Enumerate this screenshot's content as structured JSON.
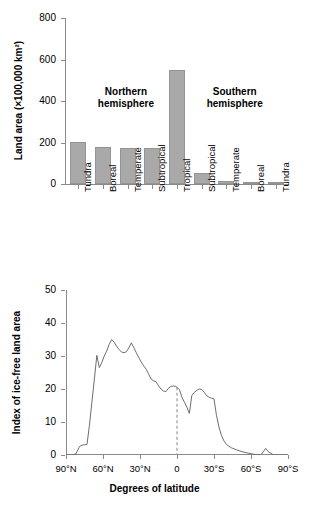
{
  "chart_data": [
    {
      "type": "bar",
      "panel": "top",
      "title": "",
      "xlabel": "",
      "ylabel": "Land area (×100,000 km²)",
      "ylim": [
        0,
        800
      ],
      "yticks": [
        0,
        200,
        400,
        600,
        800
      ],
      "ytick_labels": [
        "0",
        "200",
        "400",
        "600",
        "800"
      ],
      "grid": false,
      "bar_color": "#a9a9a9",
      "bar_edge_color": "#949494",
      "categories": [
        "Tundra",
        "Boreal",
        "Temperate",
        "Subtropical",
        "Tropical",
        "Subtropical",
        "Temperate",
        "Boreal",
        "Tundra"
      ],
      "values": [
        203,
        180,
        172,
        175,
        550,
        52,
        15,
        5,
        5
      ],
      "annotations": [
        {
          "text_line1": "Northern",
          "text_line2": "hemisphere",
          "x_frac": 0.27,
          "y_value": 470
        },
        {
          "text_line1": "Southern",
          "text_line2": "hemisphere",
          "x_frac": 0.76,
          "y_value": 470
        }
      ]
    },
    {
      "type": "line",
      "panel": "bottom",
      "title": "",
      "xlabel": "Degrees of latitude",
      "ylabel": "Index of ice-free land area",
      "ylim": [
        0,
        50
      ],
      "yticks": [
        0,
        10,
        20,
        30,
        40,
        50
      ],
      "ytick_labels": [
        "0",
        "10",
        "20",
        "30",
        "40",
        "50"
      ],
      "xlim": [
        90,
        -90
      ],
      "xticks": [
        90,
        60,
        30,
        0,
        -30,
        -60,
        -90
      ],
      "xtick_labels": [
        "90°N",
        "60°N",
        "30°N",
        "0",
        "30°S",
        "60°S",
        "90°S"
      ],
      "grid": false,
      "line_color": "#6e6e6e",
      "reference_line": {
        "x": 0,
        "style": "dashed",
        "color": "#9a9a9a",
        "y_top": 20.5
      },
      "series": [
        {
          "name": "Index of ice-free land area",
          "x": [
            90,
            86,
            82,
            79,
            77,
            75,
            73,
            71,
            69,
            67,
            65,
            63,
            61,
            59,
            57,
            55,
            53,
            51,
            49,
            47,
            45,
            43,
            41,
            39,
            37,
            35,
            33,
            31,
            29,
            27,
            25,
            23,
            21,
            19,
            17,
            15,
            13,
            11,
            9,
            7,
            5,
            3,
            1,
            0,
            -2,
            -4,
            -6,
            -8,
            -10,
            -12,
            -14,
            -16,
            -18,
            -20,
            -22,
            -24,
            -26,
            -28,
            -30,
            -32,
            -34,
            -36,
            -38,
            -40,
            -44,
            -48,
            -52,
            -56,
            -60,
            -64,
            -68,
            -70,
            -72,
            -74,
            -78,
            -82,
            -90
          ],
          "y": [
            0,
            0,
            0.3,
            2.6,
            3.0,
            3.1,
            3.2,
            9.0,
            16.0,
            23.0,
            30.2,
            26.5,
            28.0,
            30.0,
            31.5,
            33.5,
            35.0,
            34.2,
            33.0,
            32.0,
            31.2,
            31.0,
            31.3,
            32.5,
            34.0,
            32.5,
            31.0,
            29.5,
            28.2,
            27.0,
            26.0,
            24.5,
            23.0,
            22.5,
            22.2,
            21.0,
            20.0,
            19.4,
            19.2,
            20.2,
            20.8,
            20.9,
            20.8,
            20.5,
            19.8,
            17.5,
            16.0,
            14.5,
            12.6,
            18.0,
            19.0,
            19.6,
            20.0,
            19.9,
            19.0,
            18.0,
            17.5,
            17.2,
            17.0,
            12.0,
            8.5,
            6.0,
            4.3,
            3.2,
            2.2,
            1.6,
            1.1,
            0.7,
            0.4,
            0.1,
            0.0,
            1.0,
            2.0,
            1.0,
            0.1,
            0.0,
            0.0
          ]
        }
      ]
    }
  ],
  "bar_chart": {
    "ylabel": "Land area (×100,000 km²)",
    "yticks": [
      "800",
      "600",
      "400",
      "200",
      "0"
    ],
    "categories": [
      "Tundra",
      "Boreal",
      "Temperate",
      "Subtropical",
      "Tropical",
      "Subtropical",
      "Temperate",
      "Boreal",
      "Tundra"
    ],
    "annotation_north_l1": "Northern",
    "annotation_north_l2": "hemisphere",
    "annotation_south_l1": "Southern",
    "annotation_south_l2": "hemisphere"
  },
  "line_chart": {
    "ylabel": "Index of ice-free land area",
    "xlabel": "Degrees of latitude",
    "yticks": [
      "50",
      "40",
      "30",
      "20",
      "10",
      "0"
    ],
    "xticks": [
      "90°N",
      "60°N",
      "30°N",
      "0",
      "30°S",
      "60°S",
      "90°S"
    ]
  }
}
